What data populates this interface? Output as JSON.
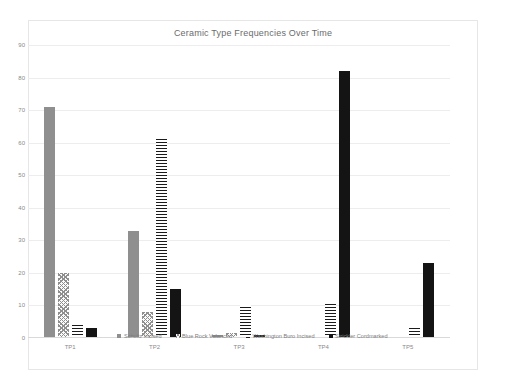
{
  "chart_data": {
    "type": "bar",
    "title": "Ceramic Type Frequencies Over Time",
    "xlabel": "",
    "ylabel": "",
    "categories": [
      "TP1",
      "TP2",
      "TP3",
      "TP4",
      "TP5"
    ],
    "series": [
      {
        "name": "Schultz Incised",
        "pattern": "solid-gray",
        "color": "#8f8f8f",
        "values": [
          71,
          33,
          1,
          0,
          0
        ]
      },
      {
        "name": "Blue Rock Valanced",
        "pattern": "crosshatch",
        "color": "#8f8f8f",
        "values": [
          20,
          8,
          1.5,
          0,
          0
        ]
      },
      {
        "name": "Washington Buro Incised",
        "pattern": "horizontal-lines",
        "color": "#1a1a1a",
        "values": [
          4.5,
          61,
          10,
          10.5,
          3
        ]
      },
      {
        "name": "Strickler Cordmarked",
        "pattern": "solid-black",
        "color": "#141414",
        "values": [
          3,
          15,
          1,
          82,
          23
        ]
      }
    ],
    "ylim": [
      0,
      90
    ],
    "yticks": [
      0,
      10,
      20,
      30,
      40,
      50,
      60,
      70,
      80,
      90
    ],
    "ytick_labels": [
      "0",
      "10",
      "20",
      "30",
      "40",
      "50",
      "60",
      "70",
      "80",
      "90"
    ],
    "grid": true,
    "legend_position": "bottom"
  }
}
